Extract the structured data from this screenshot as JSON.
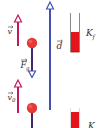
{
  "diagram": {
    "colors": {
      "velocity": "#c2185b",
      "gravity": "#3b2a6e",
      "displacement": "#3f51b5",
      "ball": "#e53935",
      "bar_fill": "#e3141b",
      "bar_outline": "#8a8a8a",
      "label": "#333333"
    },
    "labels": {
      "v": "v",
      "v0": "v",
      "v0_sub": "0",
      "Fg": "F",
      "Fg_sub": "g",
      "d": "d",
      "Kf": "K",
      "Kf_sub": "f",
      "Ki": "K"
    }
  }
}
